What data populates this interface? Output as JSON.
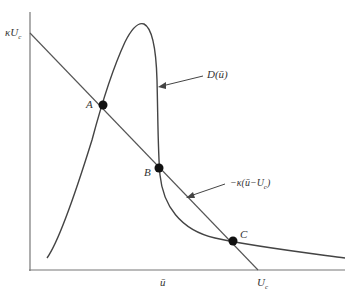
{
  "diagram": {
    "y_axis_label": "κU",
    "y_axis_label_sub": "c",
    "x_tick_ubar": "ū",
    "x_tick_uc": "U",
    "x_tick_uc_sub": "c",
    "curve_label": "D(ū)",
    "line_label": "−κ(ū−U",
    "line_label_sub": "c",
    "line_label_end": ")",
    "points": [
      {
        "name": "A",
        "x": 103,
        "y": 105
      },
      {
        "name": "B",
        "x": 159,
        "y": 168
      },
      {
        "name": "C",
        "x": 233,
        "y": 241
      }
    ],
    "colors": {
      "stroke": "#444444",
      "dot": "#111111",
      "axis": "#777777"
    }
  }
}
